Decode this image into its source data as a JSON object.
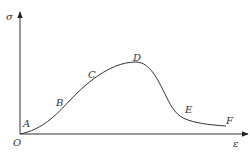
{
  "diagram": {
    "type": "stress-strain curve",
    "axes": {
      "y_label": "σ",
      "x_label": "ε",
      "origin_label": "O"
    },
    "points": [
      {
        "label": "A",
        "x": 24,
        "y": 127
      },
      {
        "label": "B",
        "x": 57,
        "y": 105
      },
      {
        "label": "C",
        "x": 88,
        "y": 78
      },
      {
        "label": "D",
        "x": 133,
        "y": 61
      },
      {
        "label": "E",
        "x": 188,
        "y": 113
      },
      {
        "label": "F",
        "x": 227,
        "y": 124
      }
    ],
    "colors": {
      "line": "#333333",
      "background": "#ffffff"
    }
  }
}
